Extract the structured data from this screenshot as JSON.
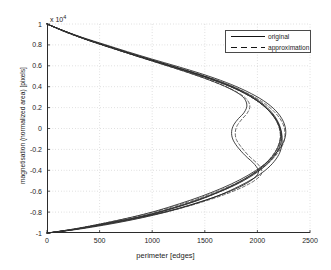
{
  "chart_data": {
    "type": "line",
    "title": "",
    "xlabel": "perimeter [edges]",
    "ylabel": "magnetisation (normalized area) [pixels]",
    "y_exponent_label": "x 10",
    "y_exponent_power": "4",
    "xlim": [
      0,
      2500
    ],
    "ylim": [
      -1,
      1
    ],
    "xticks": [
      0,
      500,
      1000,
      1500,
      2000,
      2500
    ],
    "xtick_labels": [
      "0",
      "500",
      "1000",
      "1500",
      "2000",
      "2500"
    ],
    "yticks": [
      1,
      0.8,
      0.6,
      0.4,
      0.2,
      0,
      -0.2,
      -0.4,
      -0.6,
      -0.8,
      -1
    ],
    "ytick_labels": [
      "1",
      "0.8",
      "0.6",
      "0.4",
      "0.2",
      "0",
      "-0.2",
      "-0.4",
      "-0.6",
      "-0.8",
      "-1"
    ],
    "grid": true,
    "grid_style": "dotted",
    "legend_position": "top-right",
    "legend": [
      {
        "name": "original",
        "style": "solid",
        "color": "#141414"
      },
      {
        "name": "approximation",
        "style": "dashed",
        "color": "#141414"
      }
    ],
    "series": [
      {
        "name": "original-1",
        "style": "solid",
        "points": [
          [
            0,
            1.0
          ],
          [
            170,
            0.93
          ],
          [
            350,
            0.86
          ],
          [
            560,
            0.79
          ],
          [
            790,
            0.715
          ],
          [
            1020,
            0.645
          ],
          [
            1260,
            0.575
          ],
          [
            1500,
            0.5
          ],
          [
            1720,
            0.42
          ],
          [
            1900,
            0.335
          ],
          [
            2040,
            0.245
          ],
          [
            2140,
            0.15
          ],
          [
            2200,
            0.055
          ],
          [
            2230,
            -0.04
          ],
          [
            2235,
            -0.13
          ],
          [
            2215,
            -0.225
          ],
          [
            2160,
            -0.315
          ],
          [
            2075,
            -0.4
          ],
          [
            1960,
            -0.48
          ],
          [
            1820,
            -0.555
          ],
          [
            1660,
            -0.63
          ],
          [
            1470,
            -0.7
          ],
          [
            1260,
            -0.765
          ],
          [
            1030,
            -0.825
          ],
          [
            790,
            -0.878
          ],
          [
            540,
            -0.925
          ],
          [
            290,
            -0.965
          ],
          [
            90,
            -0.99
          ],
          [
            0,
            -1.0
          ]
        ]
      },
      {
        "name": "original-2",
        "style": "solid",
        "points": [
          [
            0,
            1.0
          ],
          [
            180,
            0.925
          ],
          [
            380,
            0.85
          ],
          [
            600,
            0.78
          ],
          [
            830,
            0.705
          ],
          [
            1070,
            0.63
          ],
          [
            1310,
            0.555
          ],
          [
            1550,
            0.475
          ],
          [
            1770,
            0.39
          ],
          [
            1945,
            0.3
          ],
          [
            2075,
            0.205
          ],
          [
            2165,
            0.105
          ],
          [
            2215,
            0.005
          ],
          [
            2230,
            -0.095
          ],
          [
            2205,
            -0.19
          ],
          [
            2145,
            -0.285
          ],
          [
            2055,
            -0.375
          ],
          [
            1935,
            -0.46
          ],
          [
            1790,
            -0.54
          ],
          [
            1620,
            -0.615
          ],
          [
            1430,
            -0.69
          ],
          [
            1220,
            -0.758
          ],
          [
            1000,
            -0.82
          ],
          [
            770,
            -0.872
          ],
          [
            530,
            -0.918
          ],
          [
            285,
            -0.962
          ],
          [
            85,
            -0.99
          ],
          [
            0,
            -1.0
          ]
        ]
      },
      {
        "name": "original-3",
        "style": "solid",
        "points": [
          [
            0,
            1.0
          ],
          [
            160,
            0.935
          ],
          [
            340,
            0.87
          ],
          [
            545,
            0.805
          ],
          [
            765,
            0.735
          ],
          [
            995,
            0.665
          ],
          [
            1235,
            0.595
          ],
          [
            1480,
            0.52
          ],
          [
            1705,
            0.44
          ],
          [
            1900,
            0.355
          ],
          [
            2060,
            0.265
          ],
          [
            2175,
            0.17
          ],
          [
            2245,
            0.07
          ],
          [
            2270,
            -0.03
          ],
          [
            2250,
            -0.125
          ],
          [
            2190,
            -0.22
          ],
          [
            2100,
            -0.315
          ],
          [
            1980,
            -0.405
          ],
          [
            1835,
            -0.49
          ],
          [
            1665,
            -0.57
          ],
          [
            1470,
            -0.648
          ],
          [
            1260,
            -0.72
          ],
          [
            1035,
            -0.79
          ],
          [
            800,
            -0.85
          ],
          [
            550,
            -0.905
          ],
          [
            295,
            -0.955
          ],
          [
            90,
            -0.988
          ],
          [
            0,
            -1.0
          ]
        ]
      },
      {
        "name": "original-4",
        "style": "solid",
        "points": [
          [
            0,
            1.0
          ],
          [
            175,
            0.928
          ],
          [
            370,
            0.856
          ],
          [
            580,
            0.786
          ],
          [
            805,
            0.714
          ],
          [
            1040,
            0.642
          ],
          [
            1280,
            0.568
          ],
          [
            1520,
            0.49
          ],
          [
            1740,
            0.405
          ],
          [
            1920,
            0.315
          ],
          [
            2055,
            0.22
          ],
          [
            2150,
            0.12
          ],
          [
            2205,
            0.02
          ],
          [
            2220,
            -0.08
          ],
          [
            2195,
            -0.178
          ],
          [
            2135,
            -0.275
          ],
          [
            2045,
            -0.368
          ],
          [
            1925,
            -0.455
          ],
          [
            1780,
            -0.538
          ],
          [
            1610,
            -0.615
          ],
          [
            1420,
            -0.688
          ],
          [
            1215,
            -0.755
          ],
          [
            995,
            -0.817
          ],
          [
            765,
            -0.87
          ],
          [
            525,
            -0.915
          ],
          [
            282,
            -0.96
          ],
          [
            85,
            -0.99
          ],
          [
            0,
            -1.0
          ]
        ]
      },
      {
        "name": "original-inner",
        "style": "solid",
        "points": [
          [
            0,
            1.0
          ],
          [
            185,
            0.92
          ],
          [
            390,
            0.845
          ],
          [
            615,
            0.77
          ],
          [
            845,
            0.695
          ],
          [
            1080,
            0.62
          ],
          [
            1315,
            0.545
          ],
          [
            1540,
            0.465
          ],
          [
            1730,
            0.385
          ],
          [
            1860,
            0.305
          ],
          [
            1900,
            0.225
          ],
          [
            1875,
            0.155
          ],
          [
            1820,
            0.095
          ],
          [
            1775,
            0.035
          ],
          [
            1755,
            -0.03
          ],
          [
            1765,
            -0.1
          ],
          [
            1810,
            -0.175
          ],
          [
            1885,
            -0.26
          ],
          [
            1975,
            -0.345
          ],
          [
            2010,
            -0.42
          ],
          [
            1950,
            -0.49
          ],
          [
            1830,
            -0.56
          ],
          [
            1660,
            -0.632
          ],
          [
            1455,
            -0.702
          ],
          [
            1235,
            -0.768
          ],
          [
            1005,
            -0.825
          ],
          [
            770,
            -0.875
          ],
          [
            528,
            -0.92
          ],
          [
            285,
            -0.962
          ],
          [
            85,
            -0.99
          ],
          [
            0,
            -1.0
          ]
        ]
      },
      {
        "name": "approximation-1",
        "style": "dashed",
        "points": [
          [
            0,
            1.0
          ],
          [
            175,
            0.928
          ],
          [
            365,
            0.855
          ],
          [
            575,
            0.783
          ],
          [
            800,
            0.71
          ],
          [
            1035,
            0.638
          ],
          [
            1275,
            0.565
          ],
          [
            1515,
            0.488
          ],
          [
            1735,
            0.405
          ],
          [
            1915,
            0.318
          ],
          [
            2050,
            0.225
          ],
          [
            2145,
            0.128
          ],
          [
            2200,
            0.028
          ],
          [
            2218,
            -0.072
          ],
          [
            2195,
            -0.172
          ],
          [
            2135,
            -0.27
          ],
          [
            2045,
            -0.363
          ],
          [
            1928,
            -0.452
          ],
          [
            1782,
            -0.535
          ],
          [
            1612,
            -0.613
          ],
          [
            1422,
            -0.686
          ],
          [
            1215,
            -0.754
          ],
          [
            995,
            -0.816
          ],
          [
            765,
            -0.87
          ],
          [
            525,
            -0.916
          ],
          [
            282,
            -0.96
          ],
          [
            85,
            -0.99
          ],
          [
            0,
            -1.0
          ]
        ]
      },
      {
        "name": "approximation-2",
        "style": "dashed",
        "points": [
          [
            0,
            1.0
          ],
          [
            165,
            0.932
          ],
          [
            350,
            0.864
          ],
          [
            558,
            0.795
          ],
          [
            780,
            0.725
          ],
          [
            1010,
            0.655
          ],
          [
            1248,
            0.583
          ],
          [
            1490,
            0.507
          ],
          [
            1712,
            0.425
          ],
          [
            1902,
            0.338
          ],
          [
            2058,
            0.247
          ],
          [
            2170,
            0.15
          ],
          [
            2240,
            0.05
          ],
          [
            2262,
            -0.05
          ],
          [
            2244,
            -0.148
          ],
          [
            2185,
            -0.245
          ],
          [
            2095,
            -0.338
          ],
          [
            1975,
            -0.425
          ],
          [
            1830,
            -0.508
          ],
          [
            1660,
            -0.585
          ],
          [
            1468,
            -0.66
          ],
          [
            1258,
            -0.73
          ],
          [
            1032,
            -0.795
          ],
          [
            798,
            -0.852
          ],
          [
            548,
            -0.905
          ],
          [
            294,
            -0.955
          ],
          [
            88,
            -0.988
          ],
          [
            0,
            -1.0
          ]
        ]
      },
      {
        "name": "approximation-3",
        "style": "dashed",
        "points": [
          [
            0,
            1.0
          ],
          [
            182,
            0.922
          ],
          [
            385,
            0.848
          ],
          [
            608,
            0.775
          ],
          [
            838,
            0.702
          ],
          [
            1072,
            0.628
          ],
          [
            1308,
            0.553
          ],
          [
            1545,
            0.474
          ],
          [
            1762,
            0.392
          ],
          [
            1938,
            0.303
          ],
          [
            2070,
            0.21
          ],
          [
            2160,
            0.112
          ],
          [
            2210,
            0.012
          ],
          [
            2224,
            -0.088
          ],
          [
            2200,
            -0.185
          ],
          [
            2140,
            -0.28
          ],
          [
            2050,
            -0.372
          ],
          [
            1930,
            -0.458
          ],
          [
            1785,
            -0.54
          ],
          [
            1616,
            -0.616
          ],
          [
            1426,
            -0.688
          ],
          [
            1218,
            -0.756
          ],
          [
            998,
            -0.818
          ],
          [
            768,
            -0.871
          ],
          [
            528,
            -0.917
          ],
          [
            284,
            -0.961
          ],
          [
            85,
            -0.99
          ],
          [
            0,
            -1.0
          ]
        ]
      },
      {
        "name": "approximation-inner",
        "style": "dashed",
        "points": [
          [
            0,
            1.0
          ],
          [
            190,
            0.918
          ],
          [
            398,
            0.842
          ],
          [
            622,
            0.768
          ],
          [
            852,
            0.693
          ],
          [
            1086,
            0.618
          ],
          [
            1320,
            0.542
          ],
          [
            1548,
            0.462
          ],
          [
            1742,
            0.382
          ],
          [
            1878,
            0.3
          ],
          [
            1928,
            0.22
          ],
          [
            1905,
            0.15
          ],
          [
            1852,
            0.088
          ],
          [
            1808,
            0.028
          ],
          [
            1790,
            -0.035
          ],
          [
            1800,
            -0.105
          ],
          [
            1848,
            -0.18
          ],
          [
            1922,
            -0.265
          ],
          [
            2012,
            -0.35
          ],
          [
            2042,
            -0.425
          ],
          [
            1978,
            -0.495
          ],
          [
            1852,
            -0.565
          ],
          [
            1678,
            -0.636
          ],
          [
            1470,
            -0.705
          ],
          [
            1246,
            -0.77
          ],
          [
            1012,
            -0.827
          ],
          [
            775,
            -0.877
          ],
          [
            530,
            -0.921
          ],
          [
            286,
            -0.962
          ],
          [
            85,
            -0.99
          ],
          [
            0,
            -1.0
          ]
        ]
      }
    ]
  },
  "axes": {
    "exponent_text": "x 10",
    "exponent_sup": "4"
  }
}
